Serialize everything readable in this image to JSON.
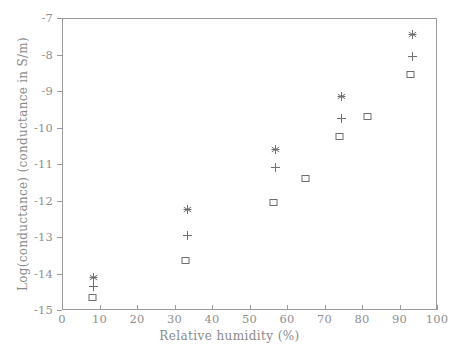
{
  "chart_data": {
    "type": "scatter",
    "title": "",
    "xlabel": "Relative humidity (%)",
    "ylabel": "Log(conductance) (conductance in S/m)",
    "xlim": [
      0,
      100
    ],
    "ylim": [
      -15,
      -7
    ],
    "xticks": [
      0,
      10,
      20,
      30,
      40,
      50,
      60,
      70,
      80,
      90,
      100
    ],
    "yticks": [
      -15,
      -14,
      -13,
      -12,
      -11,
      -10,
      -9,
      -8,
      -7
    ],
    "xtick_labels": [
      "0",
      "10",
      "20",
      "30",
      "40",
      "50",
      "60",
      "70",
      "80",
      "90",
      "100"
    ],
    "ytick_labels": [
      "-15",
      "-14",
      "-13",
      "-12",
      "-11",
      "-10",
      "-9",
      "-8",
      "-7"
    ],
    "grid": false,
    "legend": "none",
    "marker_color": "#6e6e6e",
    "series": [
      {
        "name": "asterisk",
        "marker": "asterisk",
        "points": [
          {
            "x": 8.5,
            "y": -14.1
          },
          {
            "x": 33.5,
            "y": -12.25
          },
          {
            "x": 57.0,
            "y": -10.6
          },
          {
            "x": 74.5,
            "y": -9.15
          },
          {
            "x": 93.5,
            "y": -7.45
          }
        ]
      },
      {
        "name": "plus",
        "marker": "plus",
        "points": [
          {
            "x": 8.5,
            "y": -14.35
          },
          {
            "x": 33.5,
            "y": -12.95
          },
          {
            "x": 57.0,
            "y": -11.1
          },
          {
            "x": 74.5,
            "y": -9.75
          },
          {
            "x": 93.5,
            "y": -8.05
          }
        ]
      },
      {
        "name": "square",
        "marker": "square",
        "points": [
          {
            "x": 8.0,
            "y": -14.65
          },
          {
            "x": 33.0,
            "y": -13.65
          },
          {
            "x": 56.5,
            "y": -12.05
          },
          {
            "x": 65.0,
            "y": -11.4
          },
          {
            "x": 74.0,
            "y": -10.25
          },
          {
            "x": 81.5,
            "y": -9.7
          },
          {
            "x": 93.0,
            "y": -8.55
          }
        ]
      }
    ]
  }
}
